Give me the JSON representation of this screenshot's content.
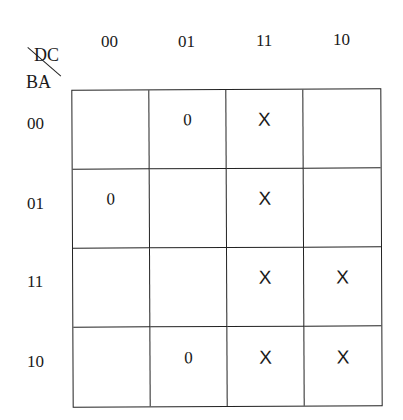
{
  "kmap": {
    "col_var": "DC",
    "row_var": "BA",
    "col_labels": [
      "00",
      "01",
      "11",
      "10"
    ],
    "row_labels": [
      "00",
      "01",
      "11",
      "10"
    ],
    "cells": [
      [
        "",
        "0",
        "X",
        ""
      ],
      [
        "0",
        "",
        "X",
        ""
      ],
      [
        "",
        "",
        "X",
        "X"
      ],
      [
        "",
        "0",
        "X",
        "X"
      ]
    ]
  }
}
